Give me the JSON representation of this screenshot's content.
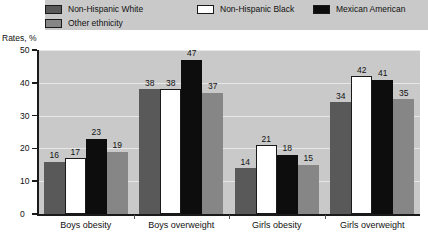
{
  "chart_data": {
    "type": "bar",
    "title": "",
    "xlabel": "",
    "ylabel": "Rates, %",
    "ylim": [
      0,
      50
    ],
    "yticks": [
      0,
      10,
      20,
      30,
      40,
      50
    ],
    "grid": true,
    "legend_position": "top",
    "categories": [
      "Boys obesity",
      "Boys overweight",
      "Girls obesity",
      "Girls overweight"
    ],
    "series": [
      {
        "name": "Non-Hispanic White",
        "color": "#595959",
        "values": [
          16,
          38,
          14,
          34
        ]
      },
      {
        "name": "Non-Hispanic Black",
        "color": "#ffffff",
        "values": [
          17,
          38,
          21,
          42
        ]
      },
      {
        "name": "Mexican American",
        "color": "#0d0d0d",
        "values": [
          23,
          47,
          18,
          41
        ]
      },
      {
        "name": "Other ethnicity",
        "color": "#868686",
        "values": [
          19,
          37,
          15,
          35
        ]
      }
    ]
  },
  "legend": {
    "items": [
      {
        "label": "Non-Hispanic White",
        "swatch": "#595959"
      },
      {
        "label": "Non-Hispanic Black",
        "swatch": "#ffffff"
      },
      {
        "label": "Mexican American",
        "swatch": "#0d0d0d"
      },
      {
        "label": "Other ethnicity",
        "swatch": "#868686"
      }
    ]
  },
  "axis": {
    "y_title": "Rates, %"
  }
}
